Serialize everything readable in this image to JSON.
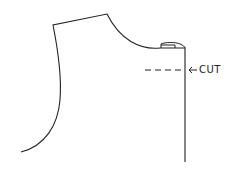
{
  "diagram": {
    "title": "",
    "annotation": {
      "label": "CUT",
      "arrow": "left-arrow"
    },
    "stroke_color": "#222222",
    "background": "#ffffff"
  }
}
